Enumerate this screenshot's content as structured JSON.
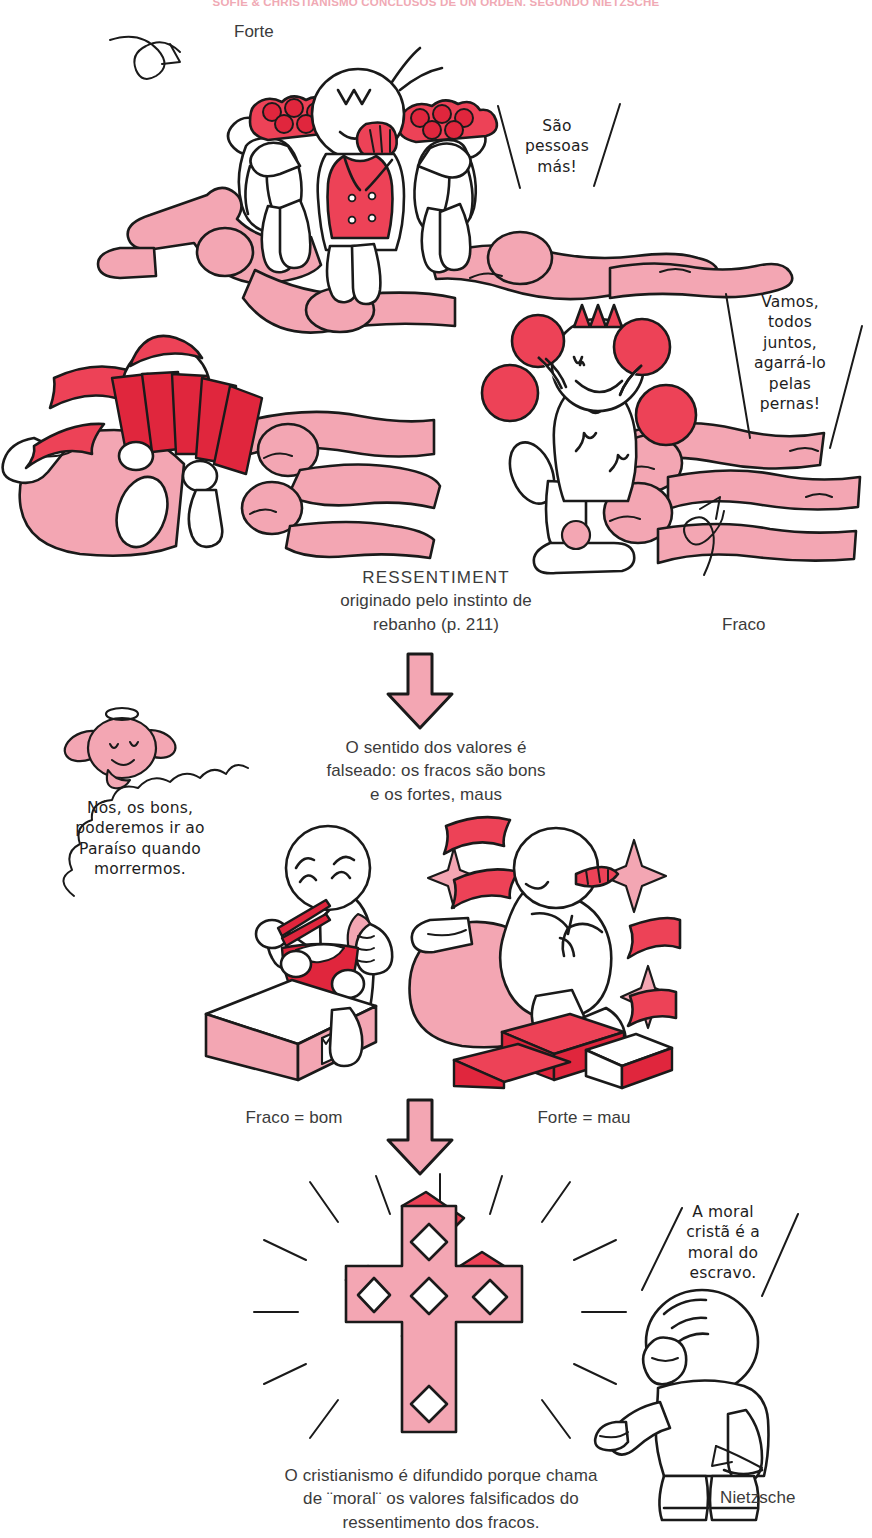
{
  "header": {
    "running_title": "SOFIE & CHRISTIANISMO CONCLUSOS DE UN ORDEN, SEGUNDO NIETZSCHE"
  },
  "panel_top": {
    "label_forte": "Forte",
    "speech_strong": "São\npessoas\nmás!"
  },
  "panel_mid_right": {
    "speech_weak": "Vamos,\ntodos\njuntos,\nagarrá-lo\npelas\npernas!",
    "label_fraco": "Fraco"
  },
  "caption_ressentiment": {
    "line1": "RESSENTIMENT",
    "line2": "originado pelo instinto de",
    "line3": "rebanho (p. 211)"
  },
  "caption_values": {
    "line1": "O sentido dos valores é",
    "line2": "falseado: os fracos são bons",
    "line3": "e os fortes, maus"
  },
  "speech_angel": {
    "line1": "Nós, os bons,",
    "line2": "poderemos ir ao",
    "line3": "Paraíso quando",
    "line4": "morrermos."
  },
  "labels_values": {
    "weak_good": "Fraco = bom",
    "strong_bad": "Forte = mau"
  },
  "speech_nietzsche": {
    "line1": "A moral",
    "line2": "cristã é a",
    "line3": "moral do",
    "line4": "escravo."
  },
  "label_nietzsche": "Nietzsche",
  "caption_conclusion": {
    "line1": "O cristianismo é difundido porque chama",
    "line2": "de ¨moral¨ os valores falsificados do",
    "line3": "ressentimento dos fracos."
  },
  "colors": {
    "ink": "#1a1a1a",
    "pink": "#f3a6b3",
    "red": "#ed4257",
    "deep_red": "#e0263d",
    "white": "#ffffff",
    "text": "#3b3b3b",
    "header_pink": "#f0a9b4"
  },
  "icons": {
    "arrow_down_1": "arrow-down-icon",
    "arrow_down_2": "arrow-down-icon",
    "pointer_forte": "curved-arrow-icon",
    "pointer_fraco": "loop-arrow-icon",
    "pointer_nietzsche": "curved-arrow-icon",
    "cross": "christian-cross-icon",
    "sparkle": "sparkle-icon"
  }
}
